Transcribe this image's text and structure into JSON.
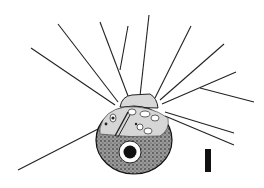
{
  "figure": {
    "scale_bar": {
      "label": ""
    },
    "colors": {
      "ink": "#111111",
      "background": "#ffffff",
      "cell_fill": "#8a8a8a"
    }
  }
}
